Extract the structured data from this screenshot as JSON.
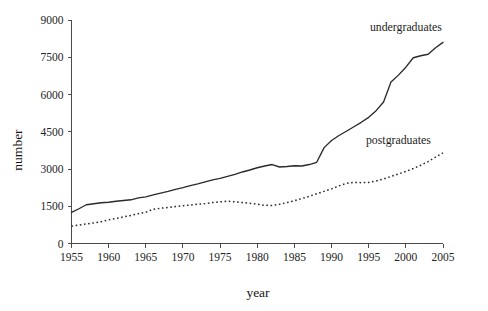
{
  "chart_data": {
    "type": "line",
    "title": "",
    "subtitle": "",
    "xlabel": "year",
    "ylabel": "number",
    "xlim": [
      1955,
      2005
    ],
    "ylim": [
      0,
      9000
    ],
    "grid": false,
    "legend_position": "inline-end-of-line",
    "x_ticks": [
      "1955",
      "1960",
      "1965",
      "1970",
      "1975",
      "1980",
      "1985",
      "1990",
      "1995",
      "2000",
      "2005"
    ],
    "x_tick_values": [
      1955,
      1960,
      1965,
      1970,
      1975,
      1980,
      1985,
      1990,
      1995,
      2000,
      2005
    ],
    "y_ticks": [
      "0",
      "1500",
      "3000",
      "4500",
      "6000",
      "7500",
      "9000"
    ],
    "y_tick_values": [
      0,
      1500,
      3000,
      4500,
      6000,
      7500,
      9000
    ],
    "x": [
      1955,
      1956,
      1957,
      1958,
      1959,
      1960,
      1961,
      1962,
      1963,
      1964,
      1965,
      1966,
      1967,
      1968,
      1969,
      1970,
      1971,
      1972,
      1973,
      1974,
      1975,
      1976,
      1977,
      1978,
      1979,
      1980,
      1981,
      1982,
      1983,
      1984,
      1985,
      1986,
      1987,
      1988,
      1989,
      1990,
      1991,
      1992,
      1993,
      1994,
      1995,
      1996,
      1997,
      1998,
      1999,
      2000,
      2001,
      2002,
      2003,
      2004,
      2005
    ],
    "series": [
      {
        "name": "undergraduates",
        "style": "solid",
        "color": "#2a2a2a",
        "values": [
          1250,
          1400,
          1560,
          1600,
          1640,
          1660,
          1700,
          1730,
          1760,
          1840,
          1880,
          1960,
          2030,
          2100,
          2180,
          2250,
          2330,
          2400,
          2480,
          2560,
          2620,
          2700,
          2780,
          2880,
          2960,
          3050,
          3120,
          3180,
          3080,
          3100,
          3130,
          3120,
          3180,
          3270,
          3860,
          4150,
          4350,
          4520,
          4700,
          4880,
          5080,
          5350,
          5700,
          6500,
          6780,
          7100,
          7480,
          7560,
          7620,
          7880,
          8100
        ]
      },
      {
        "name": "postgraduates",
        "style": "dotted",
        "color": "#2a2a2a",
        "values": [
          700,
          740,
          790,
          830,
          880,
          950,
          1010,
          1070,
          1130,
          1200,
          1260,
          1380,
          1420,
          1450,
          1490,
          1520,
          1550,
          1580,
          1610,
          1650,
          1680,
          1700,
          1680,
          1650,
          1620,
          1580,
          1540,
          1530,
          1580,
          1650,
          1720,
          1810,
          1900,
          2000,
          2100,
          2200,
          2320,
          2420,
          2460,
          2450,
          2460,
          2520,
          2600,
          2700,
          2800,
          2900,
          3020,
          3150,
          3300,
          3480,
          3650
        ]
      }
    ],
    "annotations": [
      {
        "text": "undergraduates",
        "x": 2000,
        "y": 8550
      },
      {
        "text": "postgraduates",
        "x": 1999,
        "y": 4000
      }
    ]
  },
  "axes": {
    "y_label": "number",
    "x_label": "year"
  }
}
